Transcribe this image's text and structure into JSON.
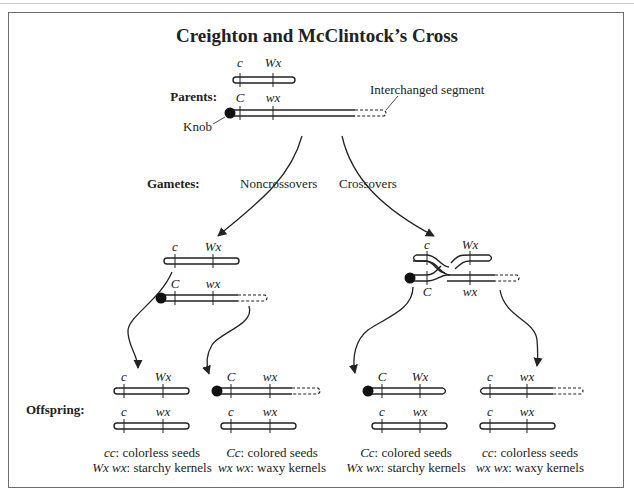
{
  "title": "Creighton and McClintock’s Cross",
  "row_labels": {
    "parents": "Parents:",
    "gametes": "Gametes:",
    "offspring": "Offspring:"
  },
  "annotations": {
    "knob": "Knob",
    "interchanged_segment": "Interchanged segment"
  },
  "branches": {
    "noncrossovers": "Noncrossovers",
    "crossovers": "Crossovers"
  },
  "parents": {
    "top": {
      "left_gene": "c",
      "right_gene": "Wx",
      "knob": false,
      "segment": false
    },
    "bottom": {
      "left_gene": "C",
      "right_gene": "wx",
      "knob": true,
      "segment": true
    }
  },
  "gametes": {
    "noncrossover": {
      "top": {
        "left_gene": "c",
        "right_gene": "Wx"
      },
      "bottom": {
        "left_gene": "C",
        "right_gene": "wx"
      }
    },
    "crossover": {
      "top": {
        "left_gene": "c",
        "right_gene": "Wx"
      },
      "bottom": {
        "left_gene": "C",
        "right_gene": "wx"
      }
    }
  },
  "offspring": [
    {
      "top": {
        "left_gene": "c",
        "right_gene": "Wx"
      },
      "bottom": {
        "left_gene": "c",
        "right_gene": "wx"
      },
      "caption_line1_gene": "cc",
      "caption_line1_text": ": colorless seeds",
      "caption_line2_gene": "Wx wx",
      "caption_line2_text": ": starchy kernels"
    },
    {
      "top": {
        "left_gene": "C",
        "right_gene": "wx"
      },
      "bottom": {
        "left_gene": "c",
        "right_gene": "wx"
      },
      "caption_line1_gene": "Cc",
      "caption_line1_text": ": colored seeds",
      "caption_line2_gene": "wx wx",
      "caption_line2_text": ": waxy kernels"
    },
    {
      "top": {
        "left_gene": "C",
        "right_gene": "Wx"
      },
      "bottom": {
        "left_gene": "c",
        "right_gene": "wx"
      },
      "caption_line1_gene": "Cc",
      "caption_line1_text": ": colored seeds",
      "caption_line2_gene": "Wx wx",
      "caption_line2_text": ": starchy kernels"
    },
    {
      "top": {
        "left_gene": "c",
        "right_gene": "wx"
      },
      "bottom": {
        "left_gene": "c",
        "right_gene": "wx"
      },
      "caption_line1_gene": "cc",
      "caption_line1_text": ": colorless seeds",
      "caption_line2_gene": "wx wx",
      "caption_line2_text": ": waxy kernels"
    }
  ]
}
